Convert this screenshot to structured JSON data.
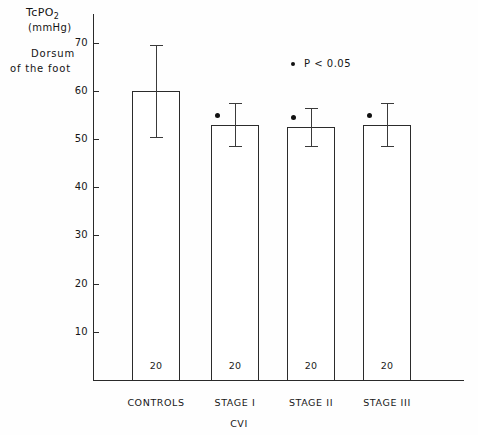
{
  "chart_data": {
    "type": "bar",
    "title": "",
    "ylabel": "TcPO2 (mmHg) Dorsum of the foot",
    "xlabel": "CVI",
    "categories": [
      "CONTROLS",
      "STAGE I",
      "STAGE II",
      "STAGE III"
    ],
    "values": [
      60,
      53,
      52.5,
      53
    ],
    "errors": [
      9.5,
      4.5,
      4.0,
      4.5
    ],
    "sample_sizes": [
      20,
      20,
      20,
      20
    ],
    "significant": [
      false,
      true,
      true,
      true
    ],
    "ylim": [
      0,
      72
    ],
    "yticks": [
      10,
      20,
      30,
      40,
      50,
      60,
      70
    ],
    "grid": false,
    "legend_position": "upper-center"
  },
  "yaxis": {
    "title_main": "TcPO",
    "title_sub": "2",
    "title_units": "(mmHg)",
    "caption_line1": "Dorsum",
    "caption_line2": "of the foot",
    "ticks": [
      {
        "label": "70",
        "value": 70
      },
      {
        "label": "60",
        "value": 60
      },
      {
        "label": "50",
        "value": 50
      },
      {
        "label": "40",
        "value": 40
      },
      {
        "label": "30",
        "value": 30
      },
      {
        "label": "20",
        "value": 20
      },
      {
        "label": "10",
        "value": 10
      }
    ]
  },
  "xaxis": {
    "group_label": "CVI",
    "categories": [
      {
        "label": "CONTROLS"
      },
      {
        "label": "STAGE I"
      },
      {
        "label": "STAGE II"
      },
      {
        "label": "STAGE III"
      }
    ]
  },
  "bars": [
    {
      "category": "CONTROLS",
      "value": 60,
      "n_label": "20",
      "significant": false
    },
    {
      "category": "STAGE I",
      "value": 53,
      "n_label": "20",
      "significant": true
    },
    {
      "category": "STAGE II",
      "value": 52.5,
      "n_label": "20",
      "significant": true
    },
    {
      "category": "STAGE III",
      "value": 53,
      "n_label": "20",
      "significant": true
    }
  ],
  "legend": {
    "marker": "significance-dot",
    "text": "P < 0.05"
  },
  "colors": {
    "axis": "#2a2a2a",
    "bar_outline": "#2b2b2b",
    "bar_fill": "#ffffff",
    "error_bar": "#3a3a3a",
    "marker": "#111111",
    "background": "#fefefe"
  }
}
